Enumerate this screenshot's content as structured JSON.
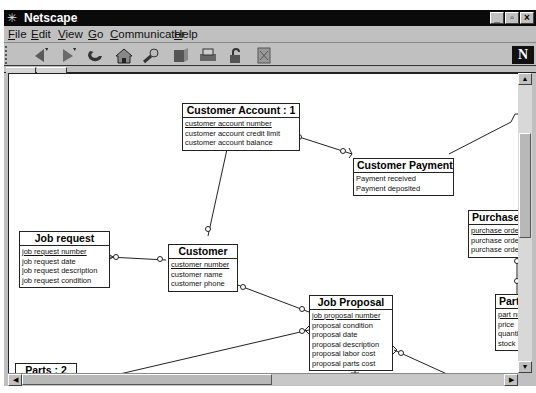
{
  "window": {
    "title": "Netscape",
    "controls": [
      "minimize",
      "restore",
      "close"
    ]
  },
  "menubar": {
    "items": [
      {
        "label": "File",
        "mnemonic": "F"
      },
      {
        "label": "Edit",
        "mnemonic": "E"
      },
      {
        "label": "View",
        "mnemonic": "V"
      },
      {
        "label": "Go",
        "mnemonic": "G"
      },
      {
        "label": "Communicator",
        "mnemonic": "C"
      },
      {
        "label": "Help",
        "mnemonic": "H"
      }
    ]
  },
  "toolbar": {
    "buttons": [
      "back-icon",
      "forward-icon",
      "reload-icon",
      "home-icon",
      "search-icon",
      "guide-icon",
      "print-icon",
      "security-icon",
      "stop-icon"
    ],
    "logo": "N"
  },
  "diagram": {
    "entities": [
      {
        "id": "customer-account",
        "name": "Customer Account : 1",
        "attributes": [
          {
            "text": "customer account number",
            "key": true
          },
          {
            "text": "customer account credit limit",
            "key": false
          },
          {
            "text": "customer account balance",
            "key": false
          }
        ]
      },
      {
        "id": "customer-payment",
        "name": "Customer Payment",
        "attributes": [
          {
            "text": "Payment received",
            "key": false
          },
          {
            "text": "Payment deposited",
            "key": false
          }
        ]
      },
      {
        "id": "job-request",
        "name": "Job request",
        "attributes": [
          {
            "text": "job request number",
            "key": true
          },
          {
            "text": "job request date",
            "key": false
          },
          {
            "text": "job request description",
            "key": false
          },
          {
            "text": "job request condition",
            "key": false
          }
        ]
      },
      {
        "id": "customer",
        "name": "Customer",
        "attributes": [
          {
            "text": "customer number",
            "key": true
          },
          {
            "text": "customer name",
            "key": false
          },
          {
            "text": "customer phone",
            "key": false
          }
        ]
      },
      {
        "id": "job-proposal",
        "name": "Job Proposal",
        "attributes": [
          {
            "text": "job proposal number",
            "key": true
          },
          {
            "text": "proposal condition",
            "key": false
          },
          {
            "text": "proposal date",
            "key": false
          },
          {
            "text": "proposal description",
            "key": false
          },
          {
            "text": "proposal labor cost",
            "key": false
          },
          {
            "text": "proposal parts cost",
            "key": false
          }
        ]
      },
      {
        "id": "purchase-order",
        "name": "Purchase",
        "attributes": [
          {
            "text": "purchase orde",
            "key": true
          },
          {
            "text": "purchase orde",
            "key": false
          },
          {
            "text": "purchase orde",
            "key": false
          }
        ]
      },
      {
        "id": "parts-right",
        "name": "Part",
        "attributes": [
          {
            "text": "part nu",
            "key": true
          },
          {
            "text": "price",
            "key": false
          },
          {
            "text": "quantit",
            "key": false
          },
          {
            "text": "stock",
            "key": false
          }
        ]
      },
      {
        "id": "parts-2",
        "name": "Parts : 2",
        "attributes": []
      }
    ]
  },
  "scrollbars": {
    "vertical": {
      "up": "▲",
      "down": "▼"
    },
    "horizontal": {
      "left": "◀",
      "right": "▶"
    }
  }
}
